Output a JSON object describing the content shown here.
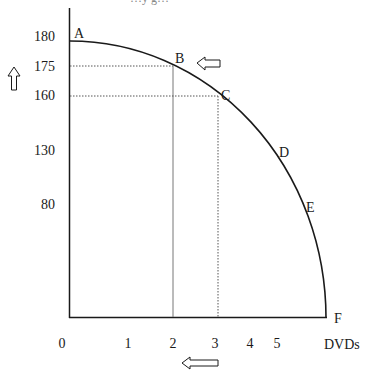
{
  "diagram": {
    "type": "production-possibilities-frontier",
    "top_text_cut": "…y g…",
    "y_axis": {
      "ticks": [
        {
          "label": "180",
          "y": 41
        },
        {
          "label": "175",
          "y": 66
        },
        {
          "label": "160",
          "y": 96
        },
        {
          "label": "130",
          "y": 150
        },
        {
          "label": "80",
          "y": 205
        }
      ],
      "arrow": "up"
    },
    "x_axis": {
      "ticks": [
        {
          "label": "0",
          "x": 62
        },
        {
          "label": "1",
          "x": 128
        },
        {
          "label": "2",
          "x": 173
        },
        {
          "label": "3",
          "x": 215
        },
        {
          "label": "4",
          "x": 250
        },
        {
          "label": "5",
          "x": 277
        }
      ],
      "title": "DVDs",
      "arrow": "left"
    },
    "points": [
      {
        "label": "A",
        "x": 0,
        "y": 180
      },
      {
        "label": "B",
        "x": 2,
        "y": 175
      },
      {
        "label": "C",
        "x": 3,
        "y": 160
      },
      {
        "label": "D",
        "x": 4,
        "y": 130
      },
      {
        "label": "E",
        "x": 5,
        "y": 80
      },
      {
        "label": "F",
        "x": 6,
        "y": 0
      }
    ],
    "colors": {
      "line": "#1a1a1a",
      "dotted": "#555555"
    }
  }
}
